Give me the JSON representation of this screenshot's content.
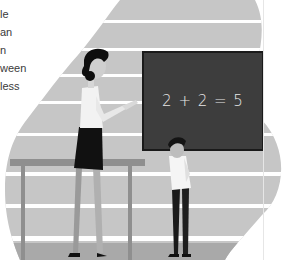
{
  "text_fragments": [
    {
      "text": "le",
      "top": 8
    },
    {
      "text": "an",
      "top": 26
    },
    {
      "text": "n",
      "top": 44
    },
    {
      "text": "ween",
      "top": 62
    },
    {
      "text": "less",
      "top": 80
    }
  ],
  "chalkboard": {
    "equation": "2 + 2 = 5"
  },
  "colors": {
    "background": "#ffffff",
    "blob": "#c6c6c6",
    "blob_dark": "#a9a9a9",
    "chalkboard": "#3d3d3d",
    "chalkboard_border": "#1a1a1a",
    "chalk": "#e8e8e8",
    "table": "#8f8f8f",
    "text": "#3a3a3a"
  }
}
